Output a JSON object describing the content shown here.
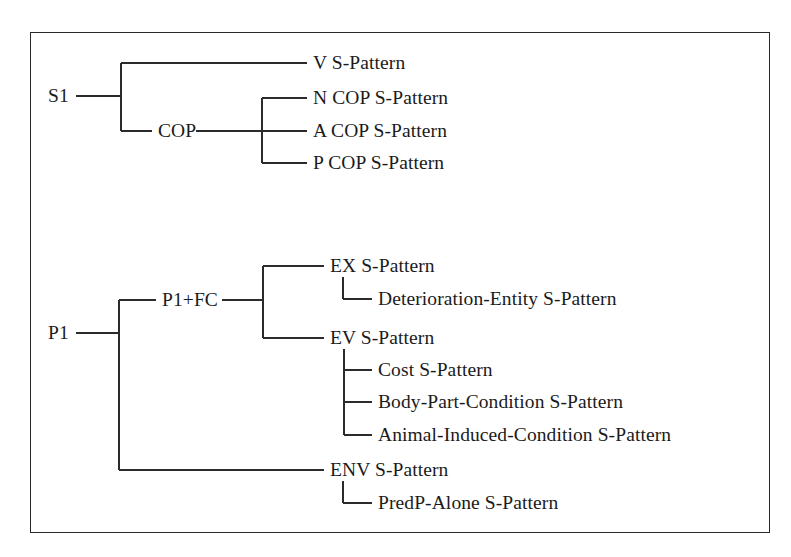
{
  "figure": {
    "type": "tree-diagram",
    "title": "",
    "border_color": "#2b2b2b",
    "line_color": "#2b2b2b",
    "text_color": "#1b1b1b",
    "background": "#ffffff"
  },
  "trees": [
    {
      "id": "s1-tree",
      "root": {
        "label": "S1",
        "x": 48,
        "y": 96
      },
      "children": [
        {
          "label": "V S-Pattern",
          "x": 313,
          "y": 63,
          "level": 1
        },
        {
          "label": "COP",
          "x": 158,
          "y": 131,
          "level": 1,
          "children": [
            {
              "label": "N COP S-Pattern",
              "x": 313,
              "y": 98,
              "level": 2
            },
            {
              "label": "A COP S-Pattern",
              "x": 313,
              "y": 131,
              "level": 2
            },
            {
              "label": "P COP S-Pattern",
              "x": 313,
              "y": 163,
              "level": 2
            }
          ]
        }
      ]
    },
    {
      "id": "p1-tree",
      "root": {
        "label": "P1",
        "x": 48,
        "y": 333
      },
      "children": [
        {
          "label": "P1+FC",
          "x": 162,
          "y": 300,
          "level": 1,
          "children": [
            {
              "label": "EX S-Pattern",
              "x": 330,
              "y": 266,
              "level": 2,
              "children": [
                {
                  "label": "Deterioration-Entity S-Pattern",
                  "x": 378,
                  "y": 299,
                  "level": 3
                }
              ]
            },
            {
              "label": "EV S-Pattern",
              "x": 330,
              "y": 338,
              "level": 2,
              "children": [
                {
                  "label": "Cost S-Pattern",
                  "x": 378,
                  "y": 370,
                  "level": 3
                },
                {
                  "label": "Body-Part-Condition S-Pattern",
                  "x": 378,
                  "y": 402,
                  "level": 3
                },
                {
                  "label": "Animal-Induced-Condition S-Pattern",
                  "x": 378,
                  "y": 435,
                  "level": 3
                }
              ]
            }
          ]
        },
        {
          "label": "ENV S-Pattern",
          "x": 330,
          "y": 470,
          "level": 1,
          "children": [
            {
              "label": "PredP-Alone S-Pattern",
              "x": 378,
              "y": 503,
              "level": 2
            }
          ]
        }
      ]
    }
  ],
  "labels": {
    "s1_root": "S1",
    "s1_v": "V S-Pattern",
    "s1_cop": "COP",
    "s1_cop_n": "N COP S-Pattern",
    "s1_cop_a": "A COP S-Pattern",
    "s1_cop_p": "P COP S-Pattern",
    "p1_root": "P1",
    "p1_fc": "P1+FC",
    "p1_ex": "EX S-Pattern",
    "p1_ex_det": "Deterioration-Entity S-Pattern",
    "p1_ev": "EV S-Pattern",
    "p1_ev_cost": "Cost S-Pattern",
    "p1_ev_body": "Body-Part-Condition S-Pattern",
    "p1_ev_animal": "Animal-Induced-Condition S-Pattern",
    "p1_env": "ENV S-Pattern",
    "p1_env_predp": "PredP-Alone S-Pattern"
  }
}
